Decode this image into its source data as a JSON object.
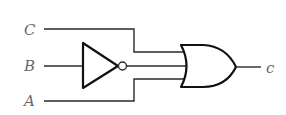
{
  "diagram": {
    "type": "logic-circuit",
    "inputs": [
      {
        "label": "C",
        "connects_to": "or-gate"
      },
      {
        "label": "B",
        "connects_to": "not-gate"
      },
      {
        "label": "A",
        "connects_to": "or-gate"
      }
    ],
    "gates": [
      {
        "type": "NOT",
        "input": "B"
      },
      {
        "type": "OR",
        "inputs": [
          "C",
          "NOT B",
          "A"
        ]
      }
    ],
    "output": {
      "label": "c"
    }
  },
  "colors": {
    "wire": "#2a2a2a",
    "gate": "#111111",
    "label": "#6a6a6a",
    "background": "#ffffff"
  }
}
